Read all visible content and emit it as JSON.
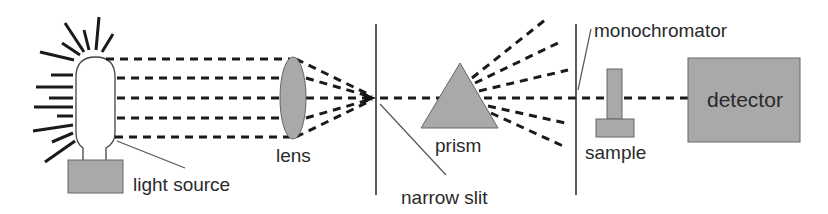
{
  "diagram": {
    "colors": {
      "background": "#ffffff",
      "component_fill": "#a9a9a9",
      "stroke": "#1a1a1a",
      "label_text": "#2a2a2a"
    },
    "components": {
      "light_source": {
        "label": "light source"
      },
      "lens": {
        "label": "lens"
      },
      "narrow_slit": {
        "label": "narrow slit"
      },
      "prism": {
        "label": "prism"
      },
      "monochromator": {
        "label": "monochromator"
      },
      "sample": {
        "label": "sample"
      },
      "detector": {
        "label": "detector"
      }
    },
    "flow": [
      "light source",
      "lens",
      "narrow slit",
      "prism",
      "monochromator",
      "sample",
      "detector"
    ]
  }
}
